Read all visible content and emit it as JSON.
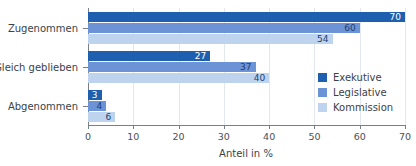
{
  "chart_data": {
    "type": "bar",
    "orientation": "horizontal",
    "title": "",
    "xlabel": "Anteil in %",
    "ylabel": "",
    "xlim": [
      0,
      70
    ],
    "xticks": [
      0,
      10,
      20,
      30,
      40,
      50,
      60,
      70
    ],
    "grid": true,
    "legend_position": "center-right",
    "categories": [
      "Zugenommen",
      "Gleich geblieben",
      "Abgenommen"
    ],
    "series": [
      {
        "name": "Exekutive",
        "color": "#1f5fb0",
        "values": [
          70,
          60,
          3
        ]
      },
      {
        "name": "Legislative",
        "color": "#6b93d6",
        "values": [
          60,
          37,
          4
        ]
      },
      {
        "name": "Kommission",
        "color": "#bdd3ee",
        "values": [
          54,
          40,
          6
        ]
      }
    ],
    "series_by_category": [
      {
        "category": "Zugenommen",
        "Exekutive": 70,
        "Legislative": 60,
        "Kommission": 54
      },
      {
        "category": "Gleich geblieben",
        "Exekutive": 27,
        "Legislative": 37,
        "Kommission": 40
      },
      {
        "category": "Abgenommen",
        "Exekutive": 3,
        "Legislative": 4,
        "Kommission": 6
      }
    ],
    "bars": [
      {
        "category": "Zugenommen",
        "series": "Exekutive",
        "value": 70,
        "label": "70",
        "label_inside": true
      },
      {
        "category": "Zugenommen",
        "series": "Legislative",
        "value": 60,
        "label": "60",
        "label_inside": true
      },
      {
        "category": "Zugenommen",
        "series": "Kommission",
        "value": 54,
        "label": "54",
        "label_inside": true
      },
      {
        "category": "Gleich geblieben",
        "series": "Exekutive",
        "value": 27,
        "label": "27",
        "label_inside": true
      },
      {
        "category": "Gleich geblieben",
        "series": "Legislative",
        "value": 37,
        "label": "37",
        "label_inside": true
      },
      {
        "category": "Gleich geblieben",
        "series": "Kommission",
        "value": 40,
        "label": "40",
        "label_inside": true
      },
      {
        "category": "Abgenommen",
        "series": "Exekutive",
        "value": 3,
        "label": "3",
        "label_inside": true
      },
      {
        "category": "Abgenommen",
        "series": "Legislative",
        "value": 4,
        "label": "4",
        "label_inside": true
      },
      {
        "category": "Abgenommen",
        "series": "Kommission",
        "value": 6,
        "label": "6",
        "label_inside": true
      }
    ],
    "ticklabels": [
      "0",
      "10",
      "20",
      "30",
      "40",
      "50",
      "60",
      "70"
    ]
  },
  "legend": {
    "items": [
      {
        "label": "Exekutive",
        "color": "#1f5fb0"
      },
      {
        "label": "Legislative",
        "color": "#6b93d6"
      },
      {
        "label": "Kommission",
        "color": "#bdd3ee"
      }
    ]
  },
  "axis": {
    "x_title": "Anteil in %"
  },
  "colors": {
    "exekutive": "#1f5fb0",
    "legislative": "#6b93d6",
    "kommission": "#bdd3ee",
    "axis": "#7a7f86",
    "grid": "#e3e7ee",
    "text": "#3c4148",
    "value_dark": "#1b3f75",
    "value_light": "#ffffff",
    "background": "#ffffff"
  }
}
